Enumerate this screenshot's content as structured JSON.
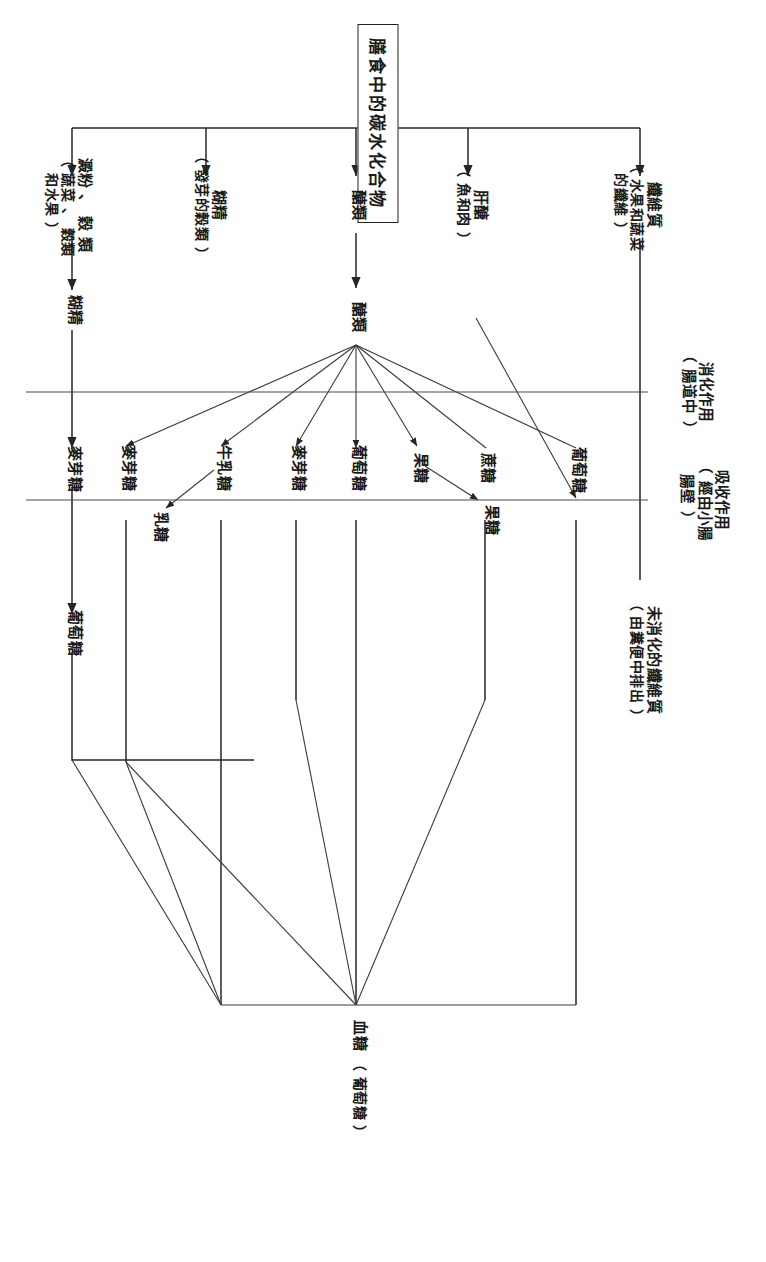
{
  "diagram": {
    "title": "膳食中的碳水化合物",
    "phases": [
      {
        "id": "digestion",
        "line1": "消化作用",
        "line2": "（ 腸道中 ）"
      },
      {
        "id": "absorption",
        "line1": "吸收作用",
        "line2": "（ 經由小腸",
        "line3": "腸壁 ）"
      }
    ],
    "sources": [
      {
        "id": "starch",
        "name": "澱粉 、 穀 類",
        "detail_line1": "（ 蔬菜 、 穀類",
        "detail_line2": "和水果 ）"
      },
      {
        "id": "dextrin",
        "name": "糊精",
        "detail_line1": "（ 發芽的穀類 ）",
        "detail_line2": ""
      },
      {
        "id": "sugars",
        "name": "醣類",
        "detail_line1": "",
        "detail_line2": ""
      },
      {
        "id": "glycogen",
        "name": "肝醣",
        "detail_line1": "（ 魚和肉 ）",
        "detail_line2": ""
      },
      {
        "id": "fiber",
        "name": "纖維質",
        "detail_line1": "（ 水果和蔬菜",
        "detail_line2": "的纖維 ）"
      }
    ],
    "stage2": [
      {
        "id": "dextrin2",
        "name": "糊精"
      },
      {
        "id": "sugars2",
        "name": "醣類"
      }
    ],
    "digestion_products": [
      {
        "id": "maltose_row1",
        "name": "麥芽糖"
      },
      {
        "id": "maltose_a",
        "name": "麥芽糖"
      },
      {
        "id": "lactose_milk",
        "name": "牛乳糖"
      },
      {
        "id": "lactose",
        "name": "乳糖"
      },
      {
        "id": "maltose_b",
        "name": "麥芽糖"
      },
      {
        "id": "glucose_mid",
        "name": "葡萄糖"
      },
      {
        "id": "fructose_a",
        "name": "果糖"
      },
      {
        "id": "sucrose",
        "name": "蔗糖"
      },
      {
        "id": "fructose_b",
        "name": "果糖"
      },
      {
        "id": "glucose_row1",
        "name": "葡萄糖"
      },
      {
        "id": "glucose_top",
        "name": "葡萄糖"
      }
    ],
    "outcomes": [
      {
        "id": "blood_sugar",
        "name": "血糖",
        "detail": "（ 葡萄糖 ）"
      },
      {
        "id": "undigested_fiber",
        "name": "未消化的纖維質",
        "detail": "（ 由糞便中排出 ）"
      }
    ]
  }
}
